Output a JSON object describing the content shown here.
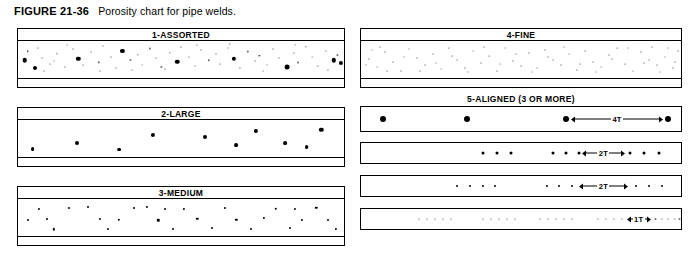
{
  "figure": {
    "label": "FIGURE 21-36",
    "caption": "Porosity chart for pipe welds."
  },
  "panels": {
    "assorted": {
      "title": "1-ASSORTED"
    },
    "large": {
      "title": "2-LARGE"
    },
    "medium": {
      "title": "3-MEDIUM"
    },
    "fine": {
      "title": "4-FINE"
    },
    "aligned": {
      "title": "5-ALIGNED (3 OR MORE)",
      "rows": [
        {
          "dimension_label": "4T"
        },
        {
          "dimension_label": "2T"
        },
        {
          "dimension_label": "2T"
        },
        {
          "dimension_label": "1T"
        }
      ]
    }
  },
  "chart_data": {
    "type": "scatter",
    "title": "Porosity chart for pipe welds.",
    "xlabel": "",
    "ylabel": "",
    "categories": [
      "1-ASSORTED",
      "2-LARGE",
      "3-MEDIUM",
      "4-FINE",
      "5-ALIGNED (3 OR MORE)"
    ],
    "grid": false,
    "legend": "none",
    "series": [
      {
        "name": "1-ASSORTED",
        "pore_count": 62,
        "pore_size_range_px": [
          0.8,
          5.0
        ],
        "points": [
          [
            2.0,
            52,
            4.6
          ],
          [
            5.3,
            74,
            4.0
          ],
          [
            3.0,
            28,
            1.4
          ],
          [
            7.5,
            45,
            1.0
          ],
          [
            9.8,
            62,
            1.2
          ],
          [
            6.2,
            18,
            1.0
          ],
          [
            12.0,
            35,
            1.3
          ],
          [
            14.5,
            70,
            1.1
          ],
          [
            11.0,
            55,
            0.9
          ],
          [
            16.8,
            22,
            1.2
          ],
          [
            18.5,
            48,
            4.4
          ],
          [
            20.0,
            66,
            1.0
          ],
          [
            22.5,
            30,
            1.1
          ],
          [
            24.8,
            58,
            1.3
          ],
          [
            26.0,
            14,
            0.9
          ],
          [
            28.4,
            42,
            1.2
          ],
          [
            30.2,
            72,
            1.0
          ],
          [
            32.0,
            26,
            4.2
          ],
          [
            34.5,
            50,
            1.1
          ],
          [
            36.8,
            38,
            1.3
          ],
          [
            38.0,
            64,
            0.9
          ],
          [
            40.5,
            20,
            1.2
          ],
          [
            42.2,
            46,
            1.0
          ],
          [
            44.0,
            70,
            1.1
          ],
          [
            46.5,
            32,
            1.3
          ],
          [
            48.8,
            56,
            4.5
          ],
          [
            50.0,
            16,
            1.0
          ],
          [
            52.4,
            44,
            1.2
          ],
          [
            54.2,
            68,
            0.9
          ],
          [
            56.0,
            24,
            1.1
          ],
          [
            58.5,
            52,
            1.3
          ],
          [
            60.8,
            36,
            1.0
          ],
          [
            62.0,
            62,
            1.2
          ],
          [
            64.5,
            18,
            0.9
          ],
          [
            66.2,
            48,
            4.3
          ],
          [
            68.0,
            74,
            1.1
          ],
          [
            70.5,
            28,
            1.2
          ],
          [
            72.8,
            54,
            1.0
          ],
          [
            74.0,
            40,
            1.3
          ],
          [
            76.5,
            66,
            0.9
          ],
          [
            78.2,
            22,
            1.1
          ],
          [
            80.0,
            46,
            1.2
          ],
          [
            82.5,
            70,
            4.8
          ],
          [
            84.8,
            32,
            1.0
          ],
          [
            86.0,
            58,
            1.1
          ],
          [
            88.4,
            16,
            1.3
          ],
          [
            90.2,
            44,
            0.9
          ],
          [
            92.0,
            68,
            1.2
          ],
          [
            94.5,
            26,
            1.0
          ],
          [
            96.8,
            52,
            4.4
          ],
          [
            98.0,
            38,
            1.1
          ],
          [
            15.0,
            12,
            0.9
          ],
          [
            35.0,
            78,
            1.0
          ],
          [
            55.0,
            10,
            1.2
          ],
          [
            75.0,
            80,
            0.9
          ],
          [
            45.0,
            76,
            1.1
          ],
          [
            25.0,
            82,
            1.0
          ],
          [
            65.0,
            8,
            1.2
          ],
          [
            85.0,
            12,
            0.9
          ],
          [
            95.0,
            78,
            1.1
          ],
          [
            8.0,
            80,
            1.0
          ],
          [
            99.0,
            60,
            4.2
          ]
        ]
      },
      {
        "name": "2-LARGE",
        "pore_count": 10,
        "pore_size_range_px": [
          3.6,
          4.4
        ],
        "points": [
          [
            4.5,
            78,
            3.8
          ],
          [
            18.0,
            62,
            4.0
          ],
          [
            31.0,
            80,
            3.8
          ],
          [
            41.5,
            40,
            4.2
          ],
          [
            57.5,
            45,
            4.0
          ],
          [
            67.0,
            68,
            3.8
          ],
          [
            73.0,
            30,
            4.2
          ],
          [
            82.0,
            62,
            3.8
          ],
          [
            88.5,
            74,
            3.8
          ],
          [
            93.0,
            26,
            4.4
          ]
        ]
      },
      {
        "name": "3-MEDIUM",
        "pore_count": 28,
        "pore_size_range_px": [
          1.8,
          2.6
        ],
        "points": [
          [
            6.5,
            26,
            2.2
          ],
          [
            3.0,
            58,
            2.0
          ],
          [
            11.0,
            82,
            2.4
          ],
          [
            15.5,
            24,
            2.2
          ],
          [
            21.5,
            22,
            2.0
          ],
          [
            27.5,
            80,
            2.2
          ],
          [
            31.0,
            56,
            2.4
          ],
          [
            35.5,
            24,
            2.0
          ],
          [
            39.5,
            22,
            2.2
          ],
          [
            43.0,
            58,
            2.4
          ],
          [
            47.5,
            80,
            2.0
          ],
          [
            51.0,
            26,
            2.2
          ],
          [
            55.0,
            54,
            2.4
          ],
          [
            59.5,
            78,
            2.0
          ],
          [
            63.5,
            24,
            2.2
          ],
          [
            67.0,
            56,
            2.4
          ],
          [
            71.5,
            80,
            2.0
          ],
          [
            75.5,
            52,
            2.2
          ],
          [
            79.0,
            26,
            2.4
          ],
          [
            83.5,
            78,
            2.0
          ],
          [
            87.0,
            56,
            2.2
          ],
          [
            91.5,
            24,
            2.4
          ],
          [
            95.0,
            58,
            2.0
          ],
          [
            97.5,
            80,
            2.2
          ],
          [
            9.0,
            54,
            2.0
          ],
          [
            25.0,
            54,
            2.2
          ],
          [
            45.0,
            26,
            2.0
          ],
          [
            85.0,
            26,
            2.2
          ]
        ]
      },
      {
        "name": "4-FINE",
        "pore_count": 64,
        "pore_size_range_px": [
          0.7,
          1.4
        ],
        "points": [
          [
            2.5,
            48,
            1.0
          ],
          [
            5.0,
            70,
            0.9
          ],
          [
            7.5,
            30,
            1.1
          ],
          [
            10.0,
            58,
            0.8
          ],
          [
            12.5,
            80,
            1.0
          ],
          [
            15.0,
            22,
            0.9
          ],
          [
            17.5,
            46,
            1.1
          ],
          [
            20.0,
            66,
            0.8
          ],
          [
            22.5,
            34,
            1.0
          ],
          [
            25.0,
            76,
            0.9
          ],
          [
            27.5,
            20,
            1.1
          ],
          [
            30.0,
            52,
            0.8
          ],
          [
            32.5,
            72,
            1.0
          ],
          [
            35.0,
            28,
            0.9
          ],
          [
            37.5,
            60,
            1.1
          ],
          [
            40.0,
            40,
            0.8
          ],
          [
            42.5,
            80,
            1.0
          ],
          [
            45.0,
            18,
            0.9
          ],
          [
            47.5,
            54,
            1.1
          ],
          [
            50.0,
            68,
            0.8
          ],
          [
            52.5,
            32,
            1.0
          ],
          [
            55.0,
            74,
            0.9
          ],
          [
            57.5,
            24,
            1.1
          ],
          [
            60.0,
            50,
            0.8
          ],
          [
            62.5,
            64,
            1.0
          ],
          [
            65.0,
            36,
            0.9
          ],
          [
            67.5,
            78,
            1.1
          ],
          [
            70.0,
            26,
            0.8
          ],
          [
            72.5,
            56,
            1.0
          ],
          [
            75.0,
            70,
            0.9
          ],
          [
            77.5,
            38,
            1.1
          ],
          [
            80.0,
            20,
            0.8
          ],
          [
            82.5,
            62,
            1.0
          ],
          [
            85.0,
            80,
            0.9
          ],
          [
            87.5,
            30,
            1.1
          ],
          [
            90.0,
            52,
            0.8
          ],
          [
            92.5,
            66,
            1.0
          ],
          [
            95.0,
            42,
            0.9
          ],
          [
            97.5,
            74,
            1.1
          ],
          [
            99.0,
            28,
            0.8
          ],
          [
            3.5,
            24,
            0.9
          ],
          [
            8.0,
            82,
            1.0
          ],
          [
            13.5,
            44,
            0.9
          ],
          [
            18.5,
            82,
            1.0
          ],
          [
            23.5,
            60,
            0.9
          ],
          [
            28.5,
            40,
            1.0
          ],
          [
            33.5,
            84,
            0.9
          ],
          [
            38.5,
            16,
            1.0
          ],
          [
            43.5,
            62,
            0.9
          ],
          [
            48.5,
            34,
            1.0
          ],
          [
            53.5,
            84,
            0.9
          ],
          [
            58.5,
            42,
            1.0
          ],
          [
            63.5,
            16,
            0.9
          ],
          [
            68.5,
            62,
            1.0
          ],
          [
            73.5,
            84,
            0.9
          ],
          [
            78.5,
            48,
            1.0
          ],
          [
            83.5,
            18,
            0.9
          ],
          [
            88.5,
            60,
            1.0
          ],
          [
            93.5,
            84,
            0.9
          ],
          [
            98.0,
            56,
            1.0
          ],
          [
            1.5,
            64,
            0.9
          ],
          [
            6.0,
            16,
            1.0
          ],
          [
            96.0,
            18,
            0.9
          ],
          [
            91.0,
            16,
            1.0
          ]
        ]
      }
    ],
    "aligned_rows": [
      {
        "row": 1,
        "pore_size_px": 6.0,
        "pore_count": 4,
        "pore_x_percent": [
          7.0,
          33.0,
          64.0,
          96.0
        ],
        "dimension_label": "4T",
        "dimension_from_percent": 65.5,
        "dimension_to_percent": 94.5
      },
      {
        "row": 2,
        "pore_size_px": 3.0,
        "pore_count": 9,
        "pore_x_percent": [
          38.0,
          42.5,
          47.0,
          60.0,
          64.0,
          68.0,
          84.0,
          88.5,
          93.0
        ],
        "dimension_label": "2T",
        "dimension_from_percent": 69.0,
        "dimension_to_percent": 82.5
      },
      {
        "row": 3,
        "pore_size_px": 2.0,
        "pore_count": 10,
        "pore_x_percent": [
          30.0,
          34.0,
          38.0,
          42.0,
          58.0,
          62.0,
          66.0,
          86.0,
          90.0,
          94.0
        ],
        "dimension_label": "2T",
        "dimension_from_percent": 68.0,
        "dimension_to_percent": 83.5
      },
      {
        "row": 4,
        "pore_size_px": 1.2,
        "pore_count": 24,
        "pore_x_percent": [
          18.0,
          20.5,
          23.0,
          25.5,
          28.0,
          38.0,
          40.5,
          43.0,
          45.5,
          48.0,
          56.0,
          58.5,
          61.0,
          63.5,
          66.0,
          74.0,
          76.5,
          79.0,
          81.5,
          92.0,
          94.0,
          96.0,
          98.0,
          99.5
        ],
        "dimension_label": "1T",
        "dimension_from_percent": 83.0,
        "dimension_to_percent": 90.5
      }
    ]
  }
}
